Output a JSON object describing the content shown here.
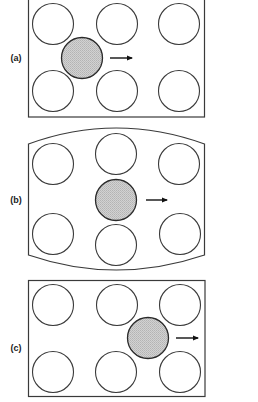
{
  "figure": {
    "colors": {
      "stroke": "#3a3a3a",
      "shaded_fill": "#c9c9c9",
      "background": "#ffffff",
      "arrow": "#111111"
    },
    "panels": [
      {
        "label": "(a)",
        "shape": "rectangle",
        "box": {
          "x": 28,
          "y": -2,
          "w": 176,
          "h": 119
        },
        "open_circles": [
          [
            53,
            24
          ],
          [
            117,
            24
          ],
          [
            179,
            24
          ],
          [
            53,
            91
          ],
          [
            117,
            91
          ],
          [
            179,
            91
          ]
        ],
        "shaded_circle": [
          82,
          58
        ],
        "arrow": {
          "x1": 110,
          "x2": 132,
          "y": 58
        },
        "label_pos": [
          16,
          61
        ]
      },
      {
        "label": "(b)",
        "shape": "barrel",
        "box": {
          "x": 28,
          "y": 143,
          "w": 177,
          "h": 112
        },
        "open_circles": [
          [
            53,
            164
          ],
          [
            116,
            154
          ],
          [
            179,
            164
          ],
          [
            53,
            234
          ],
          [
            116,
            245
          ],
          [
            180,
            234
          ]
        ],
        "shaded_circle": [
          116,
          200
        ],
        "arrow": {
          "x1": 146,
          "x2": 167,
          "y": 200
        },
        "label_pos": [
          16,
          203
        ]
      },
      {
        "label": "(c)",
        "shape": "rectangle",
        "box": {
          "x": 28,
          "y": 280,
          "w": 177,
          "h": 116
        },
        "open_circles": [
          [
            53,
            305
          ],
          [
            117,
            305
          ],
          [
            180,
            305
          ],
          [
            53,
            372
          ],
          [
            116,
            372
          ],
          [
            180,
            372
          ]
        ],
        "shaded_circle": [
          148,
          338
        ],
        "arrow": {
          "x1": 176,
          "x2": 198,
          "y": 338
        },
        "label_pos": [
          16,
          351
        ]
      }
    ],
    "circle_radius": 20.5
  }
}
